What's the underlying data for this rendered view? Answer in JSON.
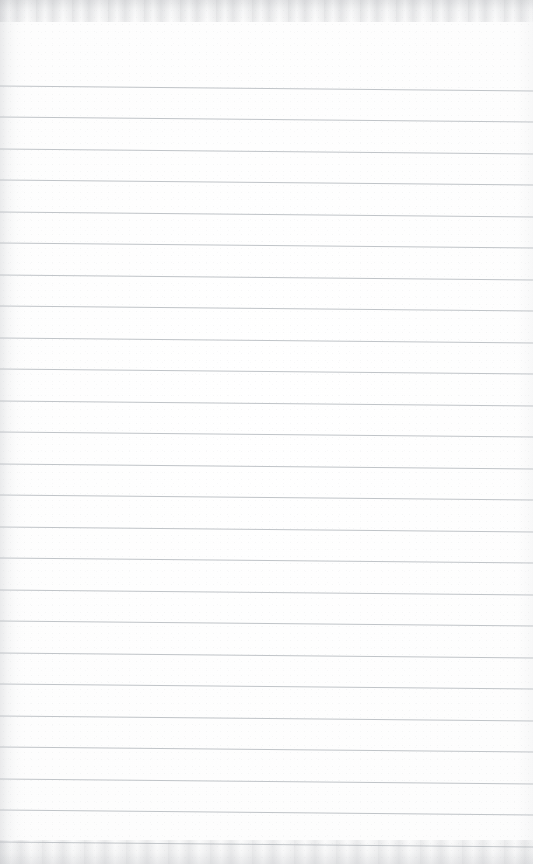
{
  "document": {
    "kind": "scanned-blank-lined-page",
    "page_width": 533,
    "page_height": 864,
    "background_color": "#fdfdfd",
    "has_text_content": false,
    "body_text": ""
  },
  "ruling": {
    "line_color": "#b9bdc2",
    "line_thickness_px": 0.9,
    "line_count": 25,
    "first_line_y": 86,
    "line_spacing_px": 31.5,
    "tilt_degrees": 0.55,
    "left_inset_px": 0,
    "right_inset_px": 0,
    "lines": [
      {
        "index": 1,
        "y_left": 86,
        "y_right": 91
      },
      {
        "index": 2,
        "y_left": 117,
        "y_right": 122
      },
      {
        "index": 3,
        "y_left": 149,
        "y_right": 154
      },
      {
        "index": 4,
        "y_left": 180,
        "y_right": 185
      },
      {
        "index": 5,
        "y_left": 212,
        "y_right": 217
      },
      {
        "index": 6,
        "y_left": 243,
        "y_right": 248
      },
      {
        "index": 7,
        "y_left": 275,
        "y_right": 280
      },
      {
        "index": 8,
        "y_left": 306,
        "y_right": 311
      },
      {
        "index": 9,
        "y_left": 338,
        "y_right": 343
      },
      {
        "index": 10,
        "y_left": 369,
        "y_right": 374
      },
      {
        "index": 11,
        "y_left": 401,
        "y_right": 406
      },
      {
        "index": 12,
        "y_left": 432,
        "y_right": 437
      },
      {
        "index": 13,
        "y_left": 464,
        "y_right": 469
      },
      {
        "index": 14,
        "y_left": 495,
        "y_right": 500
      },
      {
        "index": 15,
        "y_left": 527,
        "y_right": 532
      },
      {
        "index": 16,
        "y_left": 558,
        "y_right": 563
      },
      {
        "index": 17,
        "y_left": 590,
        "y_right": 595
      },
      {
        "index": 18,
        "y_left": 621,
        "y_right": 626
      },
      {
        "index": 19,
        "y_left": 653,
        "y_right": 658
      },
      {
        "index": 20,
        "y_left": 684,
        "y_right": 689
      },
      {
        "index": 21,
        "y_left": 716,
        "y_right": 721
      },
      {
        "index": 22,
        "y_left": 747,
        "y_right": 752
      },
      {
        "index": 23,
        "y_left": 779,
        "y_right": 784
      },
      {
        "index": 24,
        "y_left": 810,
        "y_right": 815
      },
      {
        "index": 25,
        "y_left": 842,
        "y_right": 847
      }
    ]
  },
  "scan_artifacts": {
    "top_band_color": "#babcc0",
    "top_band_height_px": 22,
    "bottom_band_color": "#bec0c4",
    "bottom_band_height_px": 24,
    "left_edge_shadow_color": "#bec0c4",
    "left_edge_shadow_width_px": 26
  }
}
